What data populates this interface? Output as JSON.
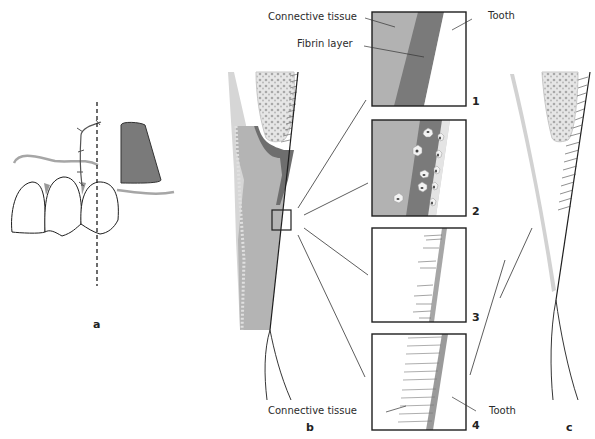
{
  "figure": {
    "panels": [
      {
        "id": "a",
        "label": "a",
        "description": "Suture line over teeth with excised tissue flap"
      },
      {
        "id": "b",
        "label": "b",
        "description": "Cross-section of gingiva with magnified healing stages"
      },
      {
        "id": "c",
        "label": "c",
        "description": "Healed attachment cross-section"
      }
    ],
    "stage_boxes": [
      {
        "number": "1",
        "description": "Connective tissue and fibrin layer against tooth"
      },
      {
        "number": "2",
        "description": "Cells migrating into fibrin layer"
      },
      {
        "number": "3",
        "description": "Early collagen fibers forming"
      },
      {
        "number": "4",
        "description": "Fibers attaching to tooth surface"
      }
    ],
    "labels": {
      "top_connective_tissue": "Connective tissue",
      "top_fibrin_layer": "Fibrin layer",
      "top_tooth": "Tooth",
      "bottom_connective_tissue": "Connective tissue",
      "bottom_tooth": "Tooth"
    },
    "colors": {
      "connective_tissue": "#b4b4b4",
      "fibrin": "#7c7c7c",
      "tooth": "#ffffff",
      "root_surface": "#9a9a9a",
      "bone": "#d8d8d8",
      "outline": "#1e1e1e",
      "gingiva_light": "#c8c8c8"
    }
  }
}
